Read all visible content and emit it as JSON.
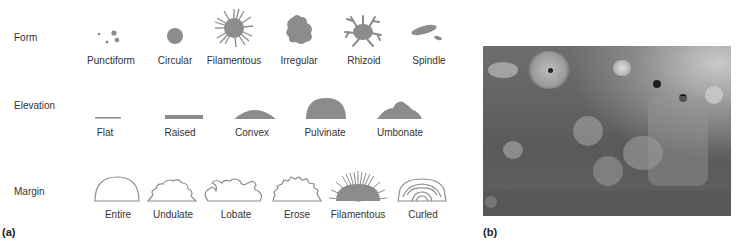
{
  "panel_a": {
    "label": "(a)",
    "rows": [
      {
        "name": "Form",
        "items": [
          "Punctiform",
          "Circular",
          "Filamentous",
          "Irregular",
          "Rhizoid",
          "Spindle"
        ]
      },
      {
        "name": "Elevation",
        "items": [
          "Flat",
          "Raised",
          "Convex",
          "Pulvinate",
          "Umbonate"
        ]
      },
      {
        "name": "Margin",
        "items": [
          "Entire",
          "Undulate",
          "Lobate",
          "Erose",
          "Filamentous",
          "Curled"
        ]
      }
    ]
  },
  "panel_b": {
    "label": "(b)",
    "image_description": "photograph of bacterial colonies on agar plate"
  },
  "colors": {
    "shape_fill": "#8c8c8c",
    "outline": "#8c8c8c",
    "text": "#333333"
  }
}
